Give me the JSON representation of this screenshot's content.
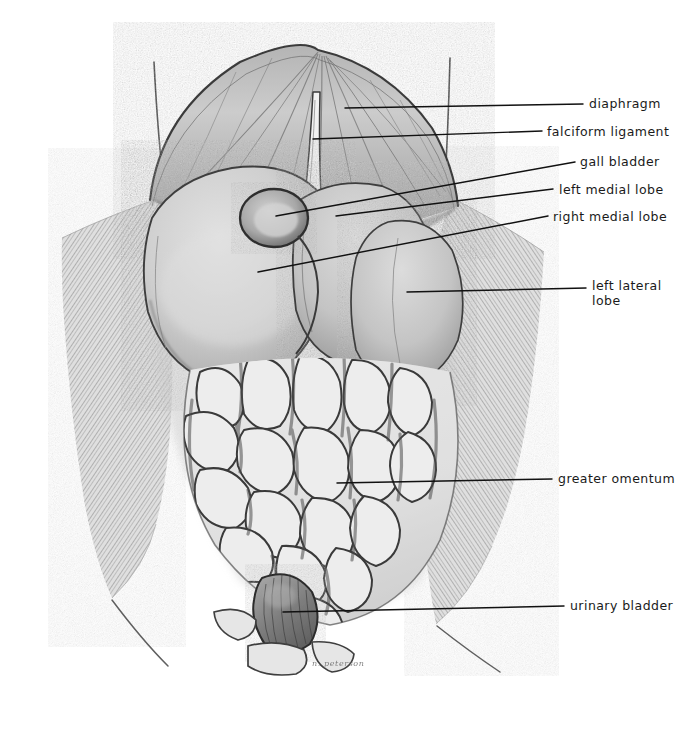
{
  "figure": {
    "signature": "n. peterson",
    "palette": {
      "paper": "#ffffff",
      "ink": "#1a1a1a",
      "organ_light": "#d6d6d6",
      "organ_mid": "#bdbdbd",
      "organ_dark": "#8f8f8f",
      "wall_light": "#dcdcdc",
      "wall_mid": "#c2c2c2",
      "leader_color": "#111111"
    }
  },
  "labels": [
    {
      "id": "diaphragm",
      "text": "diaphragm",
      "text_x": 589,
      "text_y": 96,
      "align": "left",
      "leader": {
        "x1": 345,
        "y1": 108,
        "x2": 583,
        "y2": 104
      }
    },
    {
      "id": "falciform-ligament",
      "text": "falciform ligament",
      "text_x": 547,
      "text_y": 124,
      "align": "left",
      "leader": {
        "x1": 313,
        "y1": 139,
        "x2": 542,
        "y2": 131
      }
    },
    {
      "id": "gall-bladder",
      "text": "gall bladder",
      "text_x": 580,
      "text_y": 154,
      "align": "left",
      "leader": {
        "x1": 276,
        "y1": 216,
        "x2": 575,
        "y2": 162
      }
    },
    {
      "id": "left-medial-lobe",
      "text": "left medial lobe",
      "text_x": 559,
      "text_y": 182,
      "align": "left",
      "leader": {
        "x1": 336,
        "y1": 216,
        "x2": 553,
        "y2": 189
      }
    },
    {
      "id": "right-medial-lobe",
      "text": "right medial lobe",
      "text_x": 553,
      "text_y": 209,
      "align": "left",
      "leader": {
        "x1": 258,
        "y1": 272,
        "x2": 548,
        "y2": 216
      }
    },
    {
      "id": "left-lateral-lobe",
      "text": "left lateral\nlobe",
      "text_x": 592,
      "text_y": 278,
      "align": "left",
      "leader": {
        "x1": 407,
        "y1": 292,
        "x2": 586,
        "y2": 288
      }
    },
    {
      "id": "greater-omentum",
      "text": "greater omentum",
      "text_x": 558,
      "text_y": 471,
      "align": "left",
      "leader": {
        "x1": 337,
        "y1": 483,
        "x2": 552,
        "y2": 479
      }
    },
    {
      "id": "urinary-bladder",
      "text": "urinary bladder",
      "text_x": 570,
      "text_y": 598,
      "align": "left",
      "leader": {
        "x1": 283,
        "y1": 612,
        "x2": 564,
        "y2": 606
      }
    }
  ],
  "structures": [
    {
      "id": "diaphragm",
      "name": "diaphragm"
    },
    {
      "id": "falciform-ligament",
      "name": "falciform ligament"
    },
    {
      "id": "gall-bladder",
      "name": "gall bladder"
    },
    {
      "id": "left-medial-lobe",
      "name": "left medial lobe"
    },
    {
      "id": "right-medial-lobe",
      "name": "right medial lobe"
    },
    {
      "id": "left-lateral-lobe",
      "name": "left lateral lobe"
    },
    {
      "id": "greater-omentum",
      "name": "greater omentum"
    },
    {
      "id": "urinary-bladder",
      "name": "urinary bladder"
    },
    {
      "id": "body-wall-flap-left",
      "name": "reflected body wall (left)"
    },
    {
      "id": "body-wall-flap-right",
      "name": "reflected body wall (right)"
    }
  ]
}
